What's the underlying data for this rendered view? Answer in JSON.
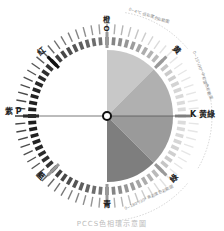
{
  "diagram": {
    "center": {
      "x": 107,
      "y": 116
    },
    "labels": {
      "top": "橙 O",
      "left": "紫 P",
      "right": "K 黄綠",
      "bottom": "青",
      "bottom_letter": "T",
      "upper_left": "紅",
      "upper_right": "黄",
      "upper_right_letter": "Y",
      "lower_right": "綠",
      "lower_right_letter": "G",
      "lower_left": "藍"
    },
    "arc_notes": {
      "top_right": "0~4°C 低彩度色彩範圍",
      "right": "0~15°/30° 中彩度色彩範圍",
      "bottom_right": "0~180°/30° 高彩度色彩範圍"
    },
    "caption": "PCCS色相環示意圖",
    "pie_wedges": [
      {
        "from": -90,
        "to": -45,
        "color": "#c8c8c8"
      },
      {
        "from": -45,
        "to": 0,
        "color": "#b0b0b0"
      },
      {
        "from": 0,
        "to": 45,
        "color": "#9a9a9a"
      },
      {
        "from": 45,
        "to": 90,
        "color": "#7e7e7e"
      }
    ],
    "colors": {
      "dark_bar": "#222222",
      "mid_bar": "#888888",
      "light_bar": "#cfcfcf",
      "axis_line": "#555555"
    }
  }
}
